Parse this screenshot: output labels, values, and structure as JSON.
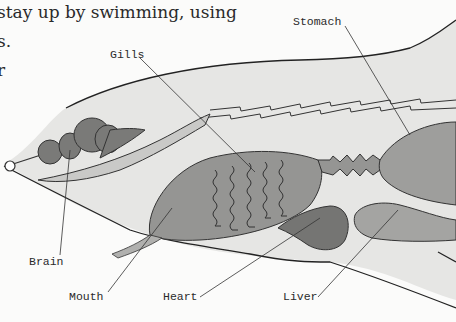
{
  "page_text": {
    "line1": "stay up by swimming, using",
    "line2": "s.",
    "line3": "r"
  },
  "diagram": {
    "labels": {
      "stomach": "Stomach",
      "gills": "Gills",
      "brain": "Brain",
      "mouth": "Mouth",
      "heart": "Heart",
      "liver": "Liver"
    },
    "colors": {
      "body_fill": "#e4e4e2",
      "organ_fill": "#8e8e8c",
      "organ_light": "#a8a8a6",
      "brain_fill": "#767674",
      "outline": "#222222"
    }
  }
}
